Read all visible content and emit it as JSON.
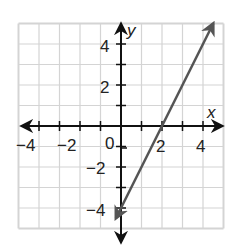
{
  "chart_data": {
    "type": "line",
    "title": "",
    "xlabel": "x",
    "ylabel": "y",
    "xlim": [
      -5,
      5
    ],
    "ylim": [
      -5,
      5
    ],
    "grid": true,
    "grid_step": 1,
    "x_tick_labels": [
      "-4",
      "-2",
      "0",
      "2",
      "4"
    ],
    "y_tick_labels": [
      "4",
      "2",
      "-2",
      "-4"
    ],
    "origin_label": "0",
    "series": [
      {
        "name": "line",
        "equation": "y = 2x - 4",
        "slope": 2,
        "y_intercept": -4,
        "x_intercept": 2,
        "points": [
          [
            -0.25,
            -4.5
          ],
          [
            0,
            -4
          ],
          [
            2,
            0
          ],
          [
            4.5,
            5
          ]
        ],
        "arrows_both_ends": true,
        "color": "#555555"
      }
    ]
  },
  "colors": {
    "grid": "#d4d4d4",
    "axis": "#111111",
    "line": "#555555"
  }
}
